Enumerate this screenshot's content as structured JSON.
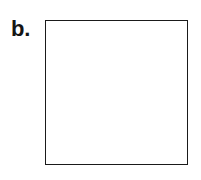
{
  "figure": {
    "panel_label": "b.",
    "label_color": "#151515",
    "frame": {
      "border_color": "#1a1a1a",
      "fill_color": "#ffffff",
      "border_width_px": 1.6,
      "x": 45,
      "y": 20,
      "width": 143,
      "height": 145
    },
    "background_color": "#ffffff",
    "content_text": ""
  }
}
